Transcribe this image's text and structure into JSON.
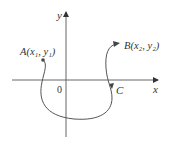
{
  "diagram": {
    "axes": {
      "x_label": "x",
      "y_label": "y",
      "origin_label": "0"
    },
    "points": [
      {
        "name": "A",
        "label": "A(x₁, y₁)"
      },
      {
        "name": "B",
        "label": "B(x₂, y₂)"
      }
    ],
    "curve": {
      "label": "C",
      "direction": "A to B"
    },
    "colors": {
      "line": "#555555",
      "text": "#333333",
      "background": "#ffffff"
    }
  }
}
